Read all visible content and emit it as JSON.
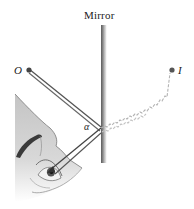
{
  "labels": {
    "mirror": "Mirror",
    "object": "O",
    "image": "I",
    "angle": "α"
  },
  "colors": {
    "ray": "#555555",
    "ray_dark": "#333333",
    "virtual_ray": "#b0b0b0",
    "mirror_dark": "#666666",
    "mirror_light": "#e6e6e6",
    "face_shade": "#cfcfcf",
    "point": "#444444"
  },
  "points": {
    "object": {
      "x": 29,
      "y": 70
    },
    "image": {
      "x": 172,
      "y": 70
    },
    "reflection": {
      "x": 100,
      "y": 130
    },
    "eye": {
      "x": 52,
      "y": 172
    }
  }
}
